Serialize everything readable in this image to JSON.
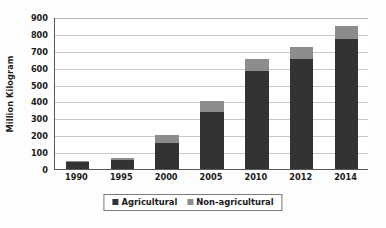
{
  "chart_data": {
    "type": "bar",
    "subtype": "stacked-vertical",
    "title": "",
    "xlabel": "",
    "ylabel": "Million Kilogram",
    "categories": [
      "1990",
      "1995",
      "2000",
      "2005",
      "2010",
      "2012",
      "2014"
    ],
    "series": [
      {
        "name": "Agricultural",
        "color": "#333333",
        "values": [
          42,
          55,
          155,
          340,
          580,
          650,
          770
        ]
      },
      {
        "name": "Non-agricultural",
        "color": "#8c8c8c",
        "values": [
          8,
          8,
          45,
          65,
          72,
          72,
          75
        ]
      }
    ],
    "totals": [
      50,
      63,
      200,
      405,
      652,
      722,
      845
    ],
    "ylim": [
      0,
      900
    ],
    "yticks": [
      0,
      100,
      200,
      300,
      400,
      500,
      600,
      700,
      800,
      900
    ],
    "ytick_labels": [
      "0",
      "100",
      "200",
      "300",
      "400",
      "500",
      "600",
      "700",
      "800",
      "900"
    ],
    "grid": true,
    "grid_axis": "y",
    "legend_position": "bottom-center",
    "legend_entries": [
      "Agricultural",
      "Non-agricultural"
    ],
    "units": "Million Kilogram"
  },
  "colors": {
    "agricultural": "#333333",
    "non_agricultural": "#8c8c8c",
    "gridline": "#c9c9c9",
    "axis": "#5a5a5a",
    "text": "#1b1b1b",
    "plot_background": "#ffffff",
    "figure_background": "#fdfdfd"
  }
}
